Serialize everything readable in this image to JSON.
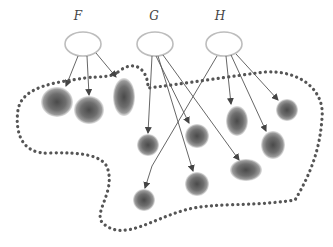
{
  "diagram": {
    "type": "mapping-diagram",
    "colors": {
      "node_stroke": "#bdbdbd",
      "edge": "#555555",
      "boundary_dots": "#555555",
      "blob_core": "#555555",
      "blob_edge": "#bbbbbb"
    },
    "sources": [
      {
        "id": "F",
        "label": "F",
        "cx": 83,
        "cy": 44,
        "rx": 18,
        "ry": 12
      },
      {
        "id": "G",
        "label": "G",
        "cx": 155,
        "cy": 44,
        "rx": 18,
        "ry": 12
      },
      {
        "id": "H",
        "label": "H",
        "cx": 224,
        "cy": 44,
        "rx": 18,
        "ry": 12
      }
    ],
    "targets": [
      {
        "id": "t1",
        "cx": 57,
        "cy": 102,
        "rx": 16,
        "ry": 15
      },
      {
        "id": "t2",
        "cx": 89,
        "cy": 110,
        "rx": 15,
        "ry": 14
      },
      {
        "id": "t3",
        "cx": 124,
        "cy": 97,
        "rx": 11,
        "ry": 19
      },
      {
        "id": "t4",
        "cx": 148,
        "cy": 145,
        "rx": 11,
        "ry": 11
      },
      {
        "id": "t5",
        "cx": 197,
        "cy": 136,
        "rx": 12,
        "ry": 12
      },
      {
        "id": "t6",
        "cx": 237,
        "cy": 121,
        "rx": 11,
        "ry": 15
      },
      {
        "id": "t7",
        "cx": 287,
        "cy": 110,
        "rx": 11,
        "ry": 11
      },
      {
        "id": "t8",
        "cx": 273,
        "cy": 145,
        "rx": 12,
        "ry": 14
      },
      {
        "id": "t9",
        "cx": 246,
        "cy": 170,
        "rx": 16,
        "ry": 11
      },
      {
        "id": "t10",
        "cx": 197,
        "cy": 184,
        "rx": 12,
        "ry": 12
      },
      {
        "id": "t11",
        "cx": 144,
        "cy": 200,
        "rx": 11,
        "ry": 11
      }
    ],
    "edges": [
      {
        "from": "F",
        "points": [
          [
            78,
            56
          ],
          [
            66,
            86
          ]
        ]
      },
      {
        "from": "F",
        "points": [
          [
            87,
            56
          ],
          [
            89,
            95
          ]
        ]
      },
      {
        "from": "F",
        "points": [
          [
            96,
            53
          ],
          [
            116,
            77
          ]
        ]
      },
      {
        "from": "G",
        "points": [
          [
            152,
            56
          ],
          [
            148,
            133
          ]
        ]
      },
      {
        "from": "G",
        "points": [
          [
            156,
            56
          ],
          [
            189,
            123
          ]
        ]
      },
      {
        "from": "G",
        "points": [
          [
            158,
            56
          ],
          [
            193,
            171
          ]
        ]
      },
      {
        "from": "G",
        "points": [
          [
            163,
            55
          ],
          [
            239,
            160
          ]
        ]
      },
      {
        "from": "H",
        "points": [
          [
            217,
            56
          ],
          [
            152,
            166
          ],
          [
            145,
            188
          ]
        ]
      },
      {
        "from": "H",
        "points": [
          [
            226,
            56
          ],
          [
            231,
            104
          ]
        ]
      },
      {
        "from": "H",
        "points": [
          [
            231,
            55
          ],
          [
            266,
            131
          ]
        ]
      },
      {
        "from": "H",
        "points": [
          [
            236,
            54
          ],
          [
            278,
            100
          ]
        ]
      }
    ],
    "boundary_path": "M 118 72 C 135 58, 148 70, 148 88 C 175 85, 240 75, 265 72 C 300 70, 325 90, 322 118 C 320 150, 310 175, 295 200 C 250 207, 215 202, 185 210 C 150 220, 125 240, 105 225 C 90 215, 115 195, 108 170 C 105 155, 80 152, 50 153 C 20 155, 15 130, 18 110 C 22 85, 60 82, 85 78 C 100 76, 110 78, 118 72 Z"
  }
}
